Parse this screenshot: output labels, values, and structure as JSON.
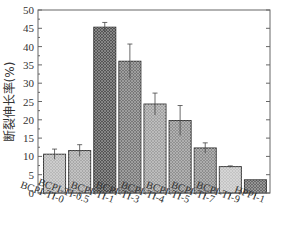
{
  "chart_data": {
    "type": "bar",
    "title": "",
    "xlabel": "",
    "ylabel": "断裂伸长率(%)",
    "ylim": [
      0,
      50
    ],
    "yticks": [
      0,
      5,
      10,
      15,
      20,
      25,
      30,
      35,
      40,
      45,
      50
    ],
    "grid": false,
    "legend": null,
    "categories": [
      "BCPI-TI-0",
      "BCPI-TI-0.5",
      "BCPI-TI-1",
      "BCPI-TI-3",
      "BCPI-TI-4",
      "BCPI-TI-5",
      "BCPI-TI-7",
      "BCPI-TI-9",
      "HPPI-1"
    ],
    "values": [
      10.6,
      11.6,
      45.3,
      36.0,
      24.3,
      19.8,
      12.3,
      7.2,
      3.6
    ],
    "error": [
      1.4,
      1.6,
      1.3,
      4.7,
      3.0,
      4.1,
      1.4,
      0.2,
      0.0
    ],
    "bar_shades": [
      "#b8b8b8",
      "#a8a8a8",
      "#555555",
      "#777777",
      "#a0a0a0",
      "#909090",
      "#8c8c8c",
      "#c4c4c4",
      "#6a6a6a"
    ]
  }
}
